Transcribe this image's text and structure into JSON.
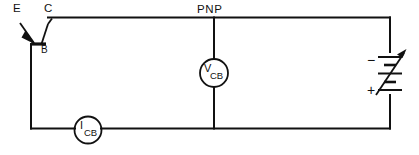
{
  "diagram": {
    "device": {
      "type_label": "PNP",
      "terminals": {
        "emitter": "E",
        "collector": "C",
        "base": "B"
      }
    },
    "meters": [
      {
        "id": "voltmeter",
        "symbol": "V",
        "subscript": "CB",
        "kind": "voltmeter",
        "connection": "parallel across collector-base rails"
      },
      {
        "id": "ammeter",
        "symbol": "I",
        "subscript": "CB",
        "kind": "ammeter",
        "connection": "series in bottom rail"
      }
    ],
    "source": {
      "kind": "variable-dc-supply",
      "negative_label": "−",
      "positive_label": "+",
      "adjustable": true
    },
    "colors": {
      "wire": "#111111",
      "background": "#ffffff",
      "text": "#111111"
    }
  }
}
